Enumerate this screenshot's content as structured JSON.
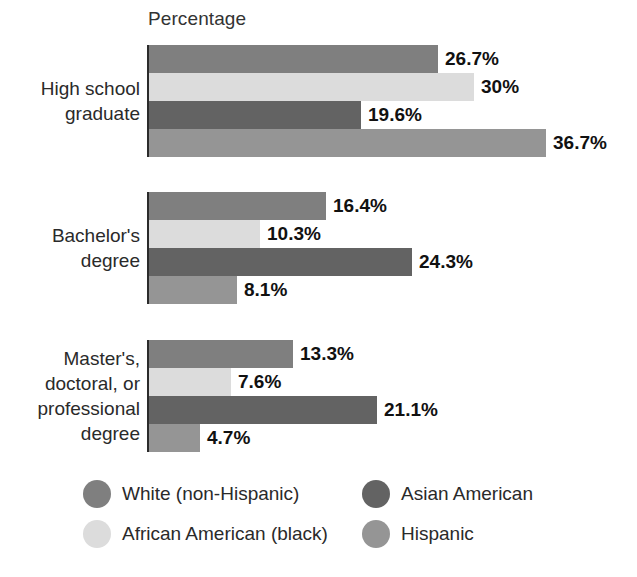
{
  "title": "Educational Attainment",
  "axis_label": "Percentage",
  "legend": {
    "items": [
      {
        "label": "White (non-Hispanic)",
        "color": "#7f7f7f",
        "key": "white"
      },
      {
        "label": "African American (black)",
        "color": "#dcdcdc",
        "key": "african_american"
      },
      {
        "label": "Asian American",
        "color": "#636363",
        "key": "asian_american"
      },
      {
        "label": "Hispanic",
        "color": "#959595",
        "key": "hispanic"
      }
    ]
  },
  "groups": [
    {
      "label": "High school\ngraduate",
      "bars": [
        {
          "series": "White (non-Hispanic)",
          "value": 26.7,
          "value_label": "26.7%",
          "color": "#7f7f7f"
        },
        {
          "series": "African American (black)",
          "value": 30,
          "value_label": "30%",
          "color": "#dcdcdc"
        },
        {
          "series": "Asian American",
          "value": 19.6,
          "value_label": "19.6%",
          "color": "#636363"
        },
        {
          "series": "Hispanic",
          "value": 36.7,
          "value_label": "36.7%",
          "color": "#959595"
        }
      ]
    },
    {
      "label": "Bachelor's\ndegree",
      "bars": [
        {
          "series": "White (non-Hispanic)",
          "value": 16.4,
          "value_label": "16.4%",
          "color": "#7f7f7f"
        },
        {
          "series": "African American (black)",
          "value": 10.3,
          "value_label": "10.3%",
          "color": "#dcdcdc"
        },
        {
          "series": "Asian American",
          "value": 24.3,
          "value_label": "24.3%",
          "color": "#636363"
        },
        {
          "series": "Hispanic",
          "value": 8.1,
          "value_label": "8.1%",
          "color": "#959595"
        }
      ]
    },
    {
      "label": "Master's,\ndoctoral, or\nprofessional\ndegree",
      "bars": [
        {
          "series": "White (non-Hispanic)",
          "value": 13.3,
          "value_label": "13.3%",
          "color": "#7f7f7f"
        },
        {
          "series": "African American (black)",
          "value": 7.6,
          "value_label": "7.6%",
          "color": "#dcdcdc"
        },
        {
          "series": "Asian American",
          "value": 21.1,
          "value_label": "21.1%",
          "color": "#636363"
        },
        {
          "series": "Hispanic",
          "value": 4.7,
          "value_label": "4.7%",
          "color": "#959595"
        }
      ]
    }
  ],
  "chart_data": {
    "type": "bar",
    "orientation": "horizontal",
    "title": "Educational Attainment",
    "xlabel": "Percentage",
    "ylabel": "",
    "xlim": [
      0,
      36.7
    ],
    "grid": false,
    "legend_position": "bottom",
    "categories": [
      "High school graduate",
      "Bachelor's degree",
      "Master's, doctoral, or professional degree"
    ],
    "series": [
      {
        "name": "White (non-Hispanic)",
        "color": "#7f7f7f",
        "values": [
          26.7,
          16.4,
          13.3
        ]
      },
      {
        "name": "African American (black)",
        "color": "#dcdcdc",
        "values": [
          30,
          10.3,
          7.6
        ]
      },
      {
        "name": "Asian American",
        "color": "#636363",
        "values": [
          19.6,
          24.3,
          21.1
        ]
      },
      {
        "name": "Hispanic",
        "color": "#959595",
        "values": [
          36.7,
          8.1,
          4.7
        ]
      }
    ],
    "data_labels": [
      [
        "26.7%",
        "30%",
        "19.6%",
        "36.7%"
      ],
      [
        "16.4%",
        "10.3%",
        "24.3%",
        "8.1%"
      ],
      [
        "13.3%",
        "7.6%",
        "21.1%",
        "4.7%"
      ]
    ]
  },
  "layout": {
    "bar_origin_x": 149,
    "px_per_unit": 10.82,
    "bar_height": 28,
    "group_tops": [
      45,
      192,
      340
    ]
  }
}
